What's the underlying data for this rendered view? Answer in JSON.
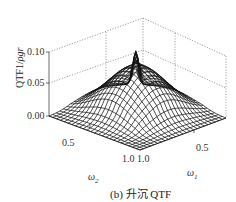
{
  "chart_data": {
    "type": "surface3d",
    "title": "",
    "caption": "(b) 升沉 QTF",
    "xlabel": "ω1",
    "ylabel": "ω2",
    "zlabel": "QTF1/ρgr",
    "z_ticks": [
      "0.00",
      "0.05",
      "0.10"
    ],
    "x_ticks": [
      "1.0",
      "0.5"
    ],
    "y_ticks": [
      "1.0",
      "0.5"
    ],
    "zlim": [
      0,
      0.1
    ],
    "xlim": [
      0.3,
      1.0
    ],
    "ylim": [
      0.3,
      1.0
    ],
    "grid": "dotted box",
    "surface_description": "Wireframe mesh; broad dome rising to ~0.08 across mid frequencies with a sharp narrow ridge/peak of ~0.11 along the diagonal ω1=ω2 near the back, falling to ~0 at the edges",
    "peak": {
      "omega1": 0.75,
      "omega2": 0.75,
      "value": 0.11
    }
  },
  "labels": {
    "z_axis": "QTF1/",
    "z_axis_italic": "ρgr",
    "z_tick_0": "0.00",
    "z_tick_1": "0.05",
    "z_tick_2": "0.10",
    "omega2_tick_half": "0.5",
    "omega1_tick_half": "0.5",
    "center_ticks": "1.0 1.0",
    "omega2": "ω",
    "omega2_sub": "2",
    "omega1": "ω",
    "omega1_sub": "1",
    "caption": "(b) 升沉 QTF"
  }
}
